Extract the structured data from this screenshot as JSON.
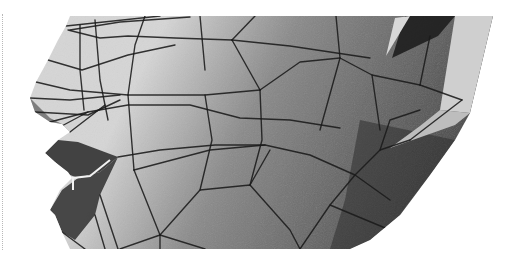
{
  "image": {
    "description": "Grayscale rendered 3D polygon face mesh, left side profile showing nose, lips, cheek and ear region",
    "width": 510,
    "height": 259
  },
  "colors": {
    "background": "#ffffff",
    "skin_light": "#d6d6d6",
    "skin_mid": "#8a8a8a",
    "skin_dark": "#4a4a4a",
    "skin_darkest": "#2e2e2e",
    "lip_dark": "#3a3a3a",
    "ear_light": "#cfcfcf",
    "mesh_line": "#1a1a1a",
    "highlight": "#f2f2f2"
  },
  "silhouette": "70,16 493,16 470,113 455,140 430,175 400,215 370,240 350,249 70,249 62,232 55,215 50,210 60,190 72,178 68,172 55,162 45,153 58,140 70,132 62,124 50,122 35,112 30,98 36,82 48,60 58,40 66,26",
  "regions": [
    {
      "name": "lower-jaw-shadow",
      "points": "360,120 455,140 430,175 400,215 370,240 350,249 330,249 345,200",
      "fill": "#2e2e2e",
      "opacity": 0.55
    },
    {
      "name": "ear-light-panel",
      "points": "455,16 493,16 470,113 440,110",
      "fill": "#cfcfcf",
      "opacity": 1
    },
    {
      "name": "ear-top-dark-wedge",
      "points": "405,16 455,16 438,36 392,58",
      "fill": "#1e1e1e",
      "opacity": 0.9
    },
    {
      "name": "ear-upper-sliver",
      "points": "395,18 410,16 386,56",
      "fill": "#d8d8d8",
      "opacity": 1
    },
    {
      "name": "ear-lower-shard",
      "points": "440,110 470,113 455,125 390,148 420,126",
      "fill": "#bdbdbd",
      "opacity": 1
    },
    {
      "name": "upper-lip",
      "points": "45,153 58,140 78,142 118,157 100,172 78,178 70,175 55,162",
      "fill": "#3a3a3a",
      "opacity": 0.95
    },
    {
      "name": "lower-lip",
      "points": "50,210 62,190 78,178 100,172 118,157 100,195 95,215 75,240 62,232 55,215",
      "fill": "#3f3f3f",
      "opacity": 0.95
    },
    {
      "name": "nostril",
      "points": "30,98 50,118 62,124 70,132 58,128 40,118 33,110",
      "fill": "#5a5a5a",
      "opacity": 0.7
    }
  ],
  "highlights": [
    {
      "name": "lip-corner-highlight",
      "points": "73,190 73,178 90,176 110,160",
      "stroke": "#f2f2f2",
      "width": 2
    }
  ],
  "mesh_lines": [
    "66,26 160,16",
    "70,30 120,22 190,17",
    "68,30 100,38 128,36 175,38 232,40",
    "232,40 290,46 370,58",
    "232,40 255,16",
    "232,40 260,90",
    "200,16 205,70",
    "145,16 135,45 128,95",
    "95,20 100,80 108,120",
    "80,25 80,70 84,110",
    "48,60 82,70 128,55 175,45",
    "36,82 70,90 128,95 205,95 260,90",
    "260,90 300,62 340,58 372,75 420,85",
    "340,58 336,16",
    "340,58 320,130",
    "372,75 380,130",
    "420,85 462,100",
    "420,85 430,36",
    "462,100 410,140",
    "30,98 70,100 120,95",
    "50,122 88,112 128,105 190,105 240,118 290,120 340,128",
    "35,112 88,115 120,100",
    "70,132 105,105",
    "58,128 88,112",
    "128,95 134,170",
    "205,95 212,140 200,190",
    "260,90 262,140 250,185",
    "118,157 160,150 215,145 265,145 310,155 355,175 390,200",
    "134,170 160,235",
    "134,170 210,150 265,145",
    "160,235 160,249",
    "160,235 200,190 250,185 290,230 300,249",
    "160,235 120,249",
    "250,185 270,150",
    "300,249 330,205 355,175 380,150 410,140",
    "330,205 390,230 420,190",
    "380,150 390,120 420,110",
    "205,249 160,235",
    "100,195 118,249",
    "95,215 105,249",
    "62,232 85,249"
  ]
}
